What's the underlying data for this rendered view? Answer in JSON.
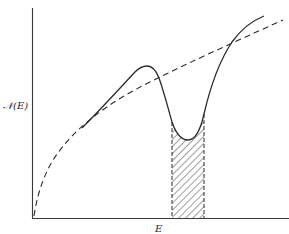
{
  "figure": {
    "type": "density-of-states-diagram",
    "y_axis_label": "𝒩(E)",
    "x_axis_label": "E",
    "colors": {
      "ink": "#2a2a2a",
      "background": "#ffffff"
    },
    "curves": [
      {
        "name": "actual-density-of-states",
        "style": "solid",
        "description": "Rises to a peak, dips to a minimum (pseudogap), then rises again"
      },
      {
        "name": "free-electron-density-of-states",
        "style": "dashed",
        "description": "Square-root-like parabolic curve starting at origin"
      }
    ],
    "shaded_region": {
      "style": "hatched",
      "description": "Band of energies around the minimum of the solid curve"
    }
  }
}
